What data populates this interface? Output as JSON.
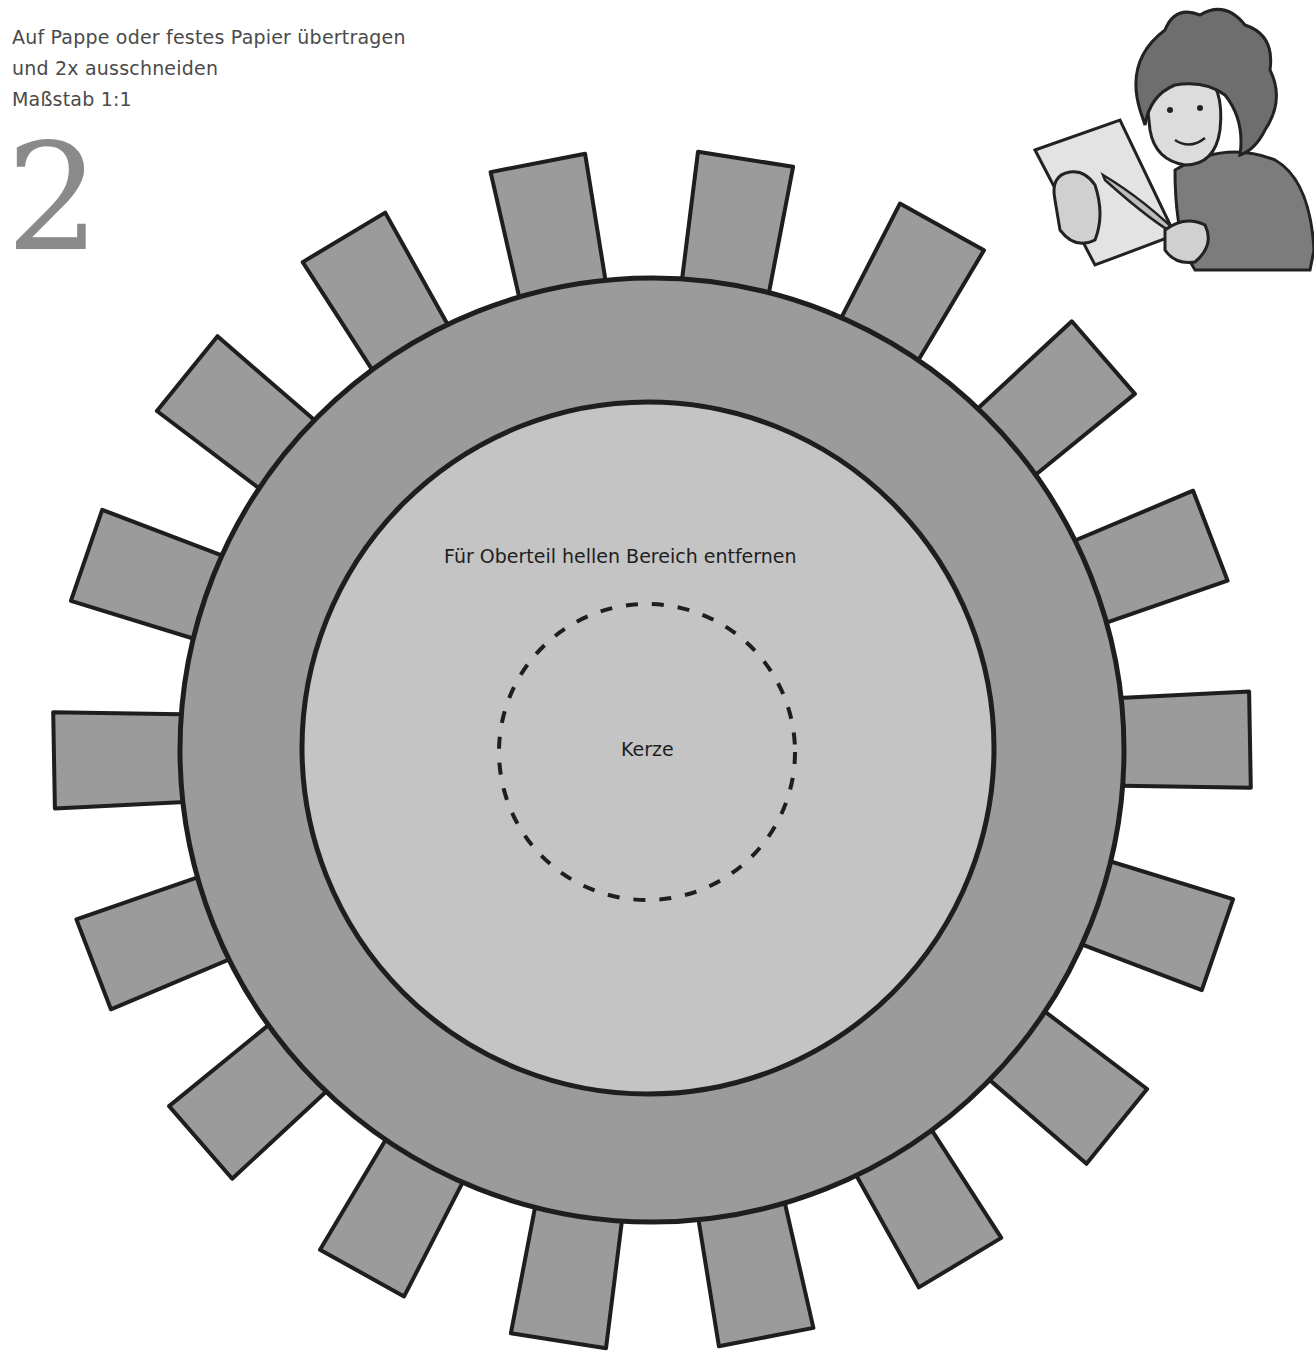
{
  "instructions": {
    "lines": [
      "Auf Pappe oder festes Papier übertragen",
      "und 2x ausschneiden",
      "Maßstab 1:1"
    ]
  },
  "step_number": "2",
  "gear": {
    "teeth_count": 18,
    "outer_fill": "#9b9b9b",
    "inner_fill": "#c4c4c4",
    "outline": "#1e1e1e",
    "label_remove_area": "Für Oberteil hellen Bereich entfernen",
    "label_candle": "Kerze"
  },
  "illustration": {
    "description": "boy-reading-paper-with-quill"
  }
}
